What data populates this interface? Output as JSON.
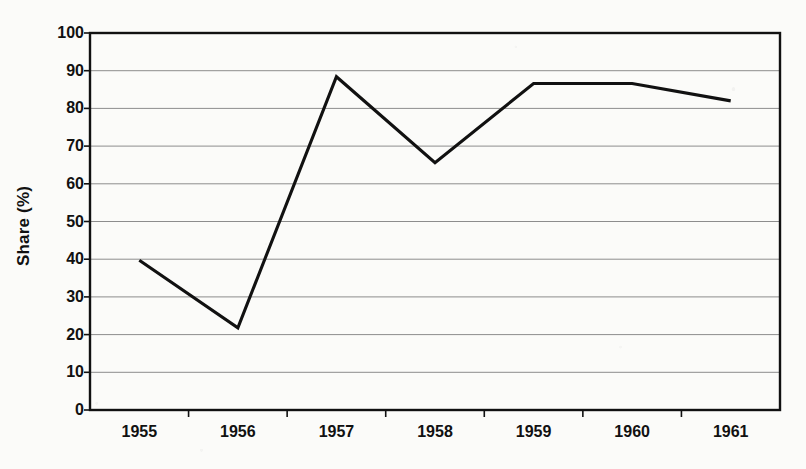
{
  "chart_data": {
    "type": "line",
    "title": "",
    "subtitle": "",
    "xlabel": "",
    "ylabel": "Share (%)",
    "categories": [
      "1955",
      "1956",
      "1957",
      "1958",
      "1959",
      "1960",
      "1961"
    ],
    "values": [
      39.7,
      21.8,
      88.4,
      65.6,
      86.6,
      86.6,
      82.0
    ],
    "series": [
      {
        "name": "Share",
        "values": [
          39.7,
          21.8,
          88.4,
          65.6,
          86.6,
          86.6,
          82.0
        ]
      }
    ],
    "ylim": [
      0,
      100
    ],
    "yticks": [
      0,
      10,
      20,
      30,
      40,
      50,
      60,
      70,
      80,
      90,
      100
    ],
    "ytick_labels": [
      "0",
      "10",
      "20",
      "30",
      "40",
      "50",
      "60",
      "70",
      "80",
      "90",
      "100"
    ],
    "grid": "horizontal",
    "legend": "none",
    "line_color": "#111111",
    "grid_color": "#8d8d8d",
    "axis_color": "#111111",
    "plot_background": "#fdfdfb"
  },
  "axes": {
    "y_axis_title": "Share (%)"
  }
}
